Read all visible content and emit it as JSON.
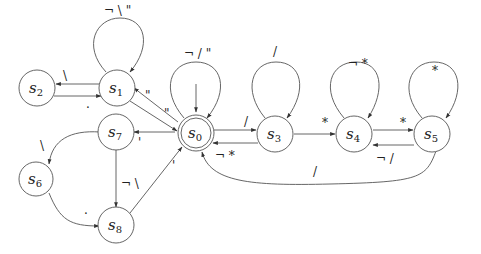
{
  "diagram": {
    "type": "finite-state-automaton",
    "colors": {
      "stroke": "#555555",
      "text": "#222222",
      "background": "#ffffff"
    },
    "states": [
      {
        "id": "s0",
        "base": "s",
        "sub": "0",
        "accepting": true,
        "initial": true
      },
      {
        "id": "s1",
        "base": "s",
        "sub": "1"
      },
      {
        "id": "s2",
        "base": "s",
        "sub": "2"
      },
      {
        "id": "s3",
        "base": "s",
        "sub": "3"
      },
      {
        "id": "s4",
        "base": "s",
        "sub": "4"
      },
      {
        "id": "s5",
        "base": "s",
        "sub": "5"
      },
      {
        "id": "s6",
        "base": "s",
        "sub": "6"
      },
      {
        "id": "s7",
        "base": "s",
        "sub": "7"
      },
      {
        "id": "s8",
        "base": "s",
        "sub": "8"
      }
    ],
    "transitions": [
      {
        "from": "s0",
        "to": "s0",
        "label": "¬ / \""
      },
      {
        "from": "s1",
        "to": "s1",
        "label": "¬ \\ \""
      },
      {
        "from": "s3",
        "to": "s3",
        "label": "/"
      },
      {
        "from": "s4",
        "to": "s4",
        "label": "¬ *"
      },
      {
        "from": "s5",
        "to": "s5",
        "label": "*"
      },
      {
        "from": "s1",
        "to": "s2",
        "label": "\\"
      },
      {
        "from": "s2",
        "to": "s1",
        "label": "."
      },
      {
        "from": "s0",
        "to": "s1",
        "label": "\""
      },
      {
        "from": "s1",
        "to": "s0",
        "label": "\""
      },
      {
        "from": "s0",
        "to": "s3",
        "label": "/"
      },
      {
        "from": "s3",
        "to": "s0",
        "label": "¬ *"
      },
      {
        "from": "s3",
        "to": "s4",
        "label": "*"
      },
      {
        "from": "s4",
        "to": "s5",
        "label": "*"
      },
      {
        "from": "s5",
        "to": "s4",
        "label": "¬ /"
      },
      {
        "from": "s5",
        "to": "s0",
        "label": "/"
      },
      {
        "from": "s0",
        "to": "s7",
        "label": "'"
      },
      {
        "from": "s7",
        "to": "s6",
        "label": "\\"
      },
      {
        "from": "s6",
        "to": "s8",
        "label": "."
      },
      {
        "from": "s7",
        "to": "s8",
        "label": "¬ \\"
      },
      {
        "from": "s8",
        "to": "s0",
        "label": "'"
      }
    ]
  }
}
